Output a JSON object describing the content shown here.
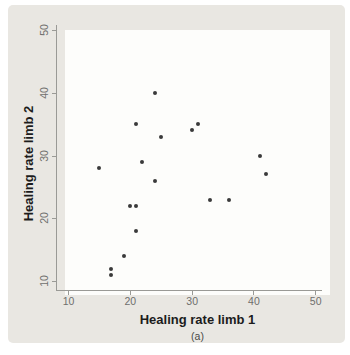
{
  "chart_data": {
    "type": "scatter",
    "title": "",
    "xlabel": "Healing rate limb 1",
    "ylabel": "Healing rate limb 2",
    "caption": "(a)",
    "x_ticks": [
      10,
      20,
      30,
      40,
      50
    ],
    "y_ticks": [
      10,
      20,
      30,
      40,
      50
    ],
    "xlim": [
      8.2,
      51.1
    ],
    "ylim": [
      8.6,
      50.8
    ],
    "grid": false,
    "legend": null,
    "points": [
      {
        "x": 15,
        "y": 28
      },
      {
        "x": 17,
        "y": 11
      },
      {
        "x": 17,
        "y": 12
      },
      {
        "x": 19,
        "y": 14
      },
      {
        "x": 20,
        "y": 22
      },
      {
        "x": 21,
        "y": 18
      },
      {
        "x": 21,
        "y": 22
      },
      {
        "x": 21,
        "y": 35
      },
      {
        "x": 22,
        "y": 29
      },
      {
        "x": 24,
        "y": 26
      },
      {
        "x": 24,
        "y": 40
      },
      {
        "x": 25,
        "y": 33
      },
      {
        "x": 30,
        "y": 34
      },
      {
        "x": 31,
        "y": 35
      },
      {
        "x": 33,
        "y": 23
      },
      {
        "x": 36,
        "y": 23
      },
      {
        "x": 41,
        "y": 30
      },
      {
        "x": 42,
        "y": 27
      }
    ],
    "colors": {
      "panel_bg": "#e9e7e2",
      "plot_bg": "#fdfdfb",
      "point": "#3a3a3a",
      "axis": "#9a9a96",
      "tick_label": "#6f6f6d",
      "axis_title": "#1c1c1c",
      "caption": "#4a4a48"
    }
  }
}
